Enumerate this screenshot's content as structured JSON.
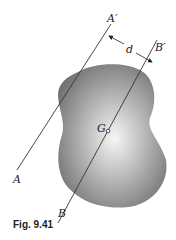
{
  "figure": {
    "caption": "Fig. 9.41",
    "labels": {
      "A": "A",
      "A_prime": "A′",
      "B": "B",
      "B_prime": "B′",
      "d": "d",
      "G": "G"
    },
    "colors": {
      "line": "#333333",
      "blob_dark": "#6e6e6e",
      "blob_light": "#f4f4f4"
    }
  }
}
